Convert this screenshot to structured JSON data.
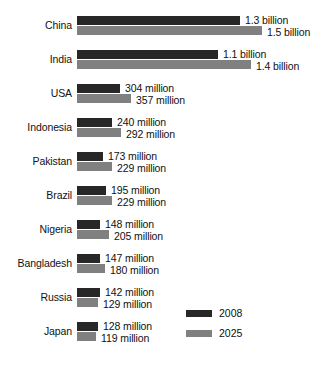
{
  "chart_data": {
    "type": "bar",
    "orientation": "horizontal",
    "title": "",
    "subtitle": "",
    "xlabel": "",
    "ylabel": "",
    "grid": false,
    "axis_visible": false,
    "xlim": [
      0,
      1500
    ],
    "unit": "millions of people",
    "legend": {
      "position": "bottom-right",
      "entries": [
        {
          "name": "2008",
          "color": "#272727"
        },
        {
          "name": "2025",
          "color": "#808080"
        }
      ]
    },
    "categories": [
      "China",
      "India",
      "USA",
      "Indonesia",
      "Pakistan",
      "Brazil",
      "Nigeria",
      "Bangladesh",
      "Russia",
      "Japan"
    ],
    "series": [
      {
        "name": "2008",
        "color": "#272727",
        "values": [
          1300,
          1100,
          304,
          240,
          173,
          195,
          148,
          147,
          142,
          128
        ],
        "labels": [
          "1.3 billion",
          "1.1 billion",
          "304 million",
          "240 million",
          "173 million",
          "195 million",
          "148 million",
          "147 million",
          "142 million",
          "128 million"
        ]
      },
      {
        "name": "2025",
        "color": "#808080",
        "values": [
          1500,
          1400,
          357,
          292,
          229,
          229,
          205,
          180,
          129,
          119
        ],
        "labels": [
          "1.5 billion",
          "1.4 billion",
          "357 million",
          "292 million",
          "229 million",
          "229 million",
          "205 million",
          "180 million",
          "129 million",
          "119 million"
        ]
      }
    ]
  },
  "rows": [
    {
      "label": "China",
      "v2008": {
        "text": "1.3 billion",
        "width_px": 163
      },
      "v2025": {
        "text": "1.5 billion",
        "width_px": 185
      }
    },
    {
      "label": "India",
      "v2008": {
        "text": "1.1 billion",
        "width_px": 141
      },
      "v2025": {
        "text": "1.4 billion",
        "width_px": 174
      }
    },
    {
      "label": "USA",
      "v2008": {
        "text": "304 million",
        "width_px": 43
      },
      "v2025": {
        "text": "357 million",
        "width_px": 54
      }
    },
    {
      "label": "Indonesia",
      "v2008": {
        "text": "240 million",
        "width_px": 35
      },
      "v2025": {
        "text": "292 million",
        "width_px": 44
      }
    },
    {
      "label": "Pakistan",
      "v2008": {
        "text": "173 million",
        "width_px": 26
      },
      "v2025": {
        "text": "229 million",
        "width_px": 35
      }
    },
    {
      "label": "Brazil",
      "v2008": {
        "text": "195 million",
        "width_px": 29
      },
      "v2025": {
        "text": "229 million",
        "width_px": 35
      }
    },
    {
      "label": "Nigeria",
      "v2008": {
        "text": "148 million",
        "width_px": 23
      },
      "v2025": {
        "text": "205 million",
        "width_px": 32
      }
    },
    {
      "label": "Bangladesh",
      "v2008": {
        "text": "147 million",
        "width_px": 23
      },
      "v2025": {
        "text": "180 million",
        "width_px": 28
      }
    },
    {
      "label": "Russia",
      "v2008": {
        "text": "142 million",
        "width_px": 23
      },
      "v2025": {
        "text": "129 million",
        "width_px": 21
      }
    },
    {
      "label": "Japan",
      "v2008": {
        "text": "128 million",
        "width_px": 21
      },
      "v2025": {
        "text": "119 million",
        "width_px": 19
      }
    }
  ],
  "legend": {
    "items": [
      {
        "label": "2008",
        "color": "#272727"
      },
      {
        "label": "2025",
        "color": "#808080"
      }
    ]
  },
  "layout": {
    "row_top_start": 12,
    "row_step": 34,
    "bars_left": 77,
    "label_gap": 5
  }
}
